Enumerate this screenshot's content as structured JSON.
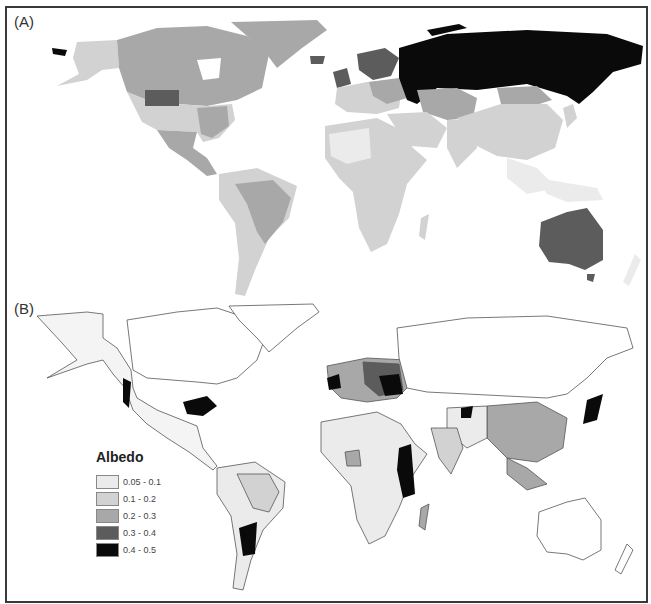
{
  "figure": {
    "panels": [
      {
        "label": "(A)",
        "description": "Country-level mean surface albedo"
      },
      {
        "label": "(B)",
        "description": "High-resolution surface albedo with country borders"
      }
    ],
    "legend": {
      "title": "Albedo",
      "items": [
        {
          "label": "0.05 - 0.1",
          "color": "#ebebeb"
        },
        {
          "label": "0.1 - 0.2",
          "color": "#d2d2d2"
        },
        {
          "label": "0.2 - 0.3",
          "color": "#a8a8a8"
        },
        {
          "label": "0.3 - 0.4",
          "color": "#5c5c5c"
        },
        {
          "label": "0.4 - 0.5",
          "color": "#0a0a0a"
        }
      ]
    },
    "colors": {
      "frame": "#3a3a3a",
      "background": "#ffffff",
      "outline": "#555555"
    }
  }
}
